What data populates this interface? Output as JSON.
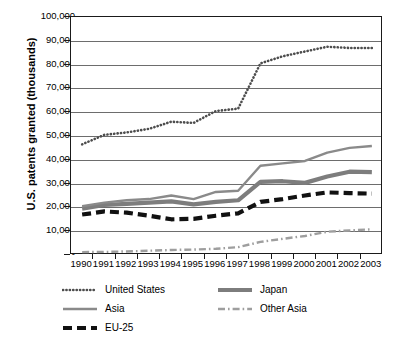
{
  "chart_data": {
    "type": "line",
    "title": "",
    "xlabel": "",
    "ylabel": "U.S. patents granted (thousands)",
    "categories": [
      "1990",
      "1991",
      "1992",
      "1993",
      "1994",
      "1995",
      "1996",
      "1997",
      "1998",
      "1999",
      "2000",
      "2001",
      "2002",
      "2003"
    ],
    "x": [
      1990,
      1991,
      1992,
      1993,
      1994,
      1995,
      1996,
      1997,
      1998,
      1999,
      2000,
      2001,
      2002,
      2003
    ],
    "ylim": [
      0,
      100000
    ],
    "ytick_labels": [
      "100,000",
      "90,000",
      "80,000",
      "70,000",
      "60,000",
      "50,000",
      "40,000",
      "30,000",
      "20,000",
      "10,000",
      "-"
    ],
    "ytick_values": [
      100000,
      90000,
      80000,
      70000,
      60000,
      50000,
      40000,
      30000,
      20000,
      10000,
      0
    ],
    "grid": true,
    "legend_position": "bottom",
    "series": [
      {
        "name": "United States",
        "style": "dotted",
        "color": "#4d4d4d",
        "values": [
          46500,
          50500,
          51500,
          53000,
          56000,
          55500,
          60500,
          61500,
          80500,
          83500,
          85500,
          87500,
          87000,
          87000
        ]
      },
      {
        "name": "Japan",
        "style": "solid-thick",
        "color": "#7d7d7d",
        "values": [
          19500,
          21000,
          21500,
          22000,
          22500,
          21300,
          22300,
          23000,
          30700,
          31000,
          30300,
          33000,
          35000,
          34800
        ]
      },
      {
        "name": "Asia",
        "style": "solid",
        "color": "#8a8a8a",
        "values": [
          20500,
          22000,
          23000,
          23500,
          25000,
          23500,
          26500,
          27000,
          37500,
          38500,
          39500,
          43000,
          45000,
          45800
        ]
      },
      {
        "name": "Other Asia",
        "style": "dash-dot",
        "color": "#9e9e9e",
        "values": [
          1200,
          1300,
          1500,
          1800,
          2100,
          2300,
          2600,
          3300,
          5500,
          6800,
          8000,
          9800,
          10300,
          10800
        ]
      },
      {
        "name": "EU-25",
        "style": "dashed-thick",
        "color": "#111111",
        "values": [
          17000,
          18300,
          17800,
          16500,
          15000,
          15200,
          16500,
          17500,
          22300,
          23500,
          25000,
          26300,
          26000,
          25800
        ]
      }
    ],
    "legend": [
      {
        "label": "United States",
        "style": "dotted",
        "color": "#4d4d4d",
        "col": 0,
        "row": 0
      },
      {
        "label": "Japan",
        "style": "solid-thick",
        "color": "#7d7d7d",
        "col": 1,
        "row": 0
      },
      {
        "label": "Asia",
        "style": "solid",
        "color": "#8a8a8a",
        "col": 0,
        "row": 1
      },
      {
        "label": "Other Asia",
        "style": "dash-dot",
        "color": "#9e9e9e",
        "col": 1,
        "row": 1
      },
      {
        "label": "EU-25",
        "style": "dashed-thick",
        "color": "#111111",
        "col": 0,
        "row": 2
      }
    ]
  }
}
